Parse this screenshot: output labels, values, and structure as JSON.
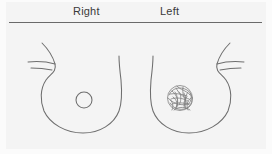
{
  "figure": {
    "title_right": "Right",
    "title_left": "Left",
    "background_color": "#f4f4f4",
    "line_color": "#6e6e6e",
    "rule_color": "#6a6a6a",
    "text_color": "#3a3a3a"
  },
  "diagram": {
    "type": "breast-examination-diagram",
    "right_breast": {
      "finding": "normal-nipple",
      "marker_shape": "circle",
      "marker_center_x": 84,
      "marker_center_y": 100,
      "marker_radius": 8
    },
    "left_breast": {
      "finding": "mass-lesion",
      "marker_shape": "scribble-blob",
      "marker_center_x": 180,
      "marker_center_y": 98,
      "marker_radius": 13
    }
  }
}
